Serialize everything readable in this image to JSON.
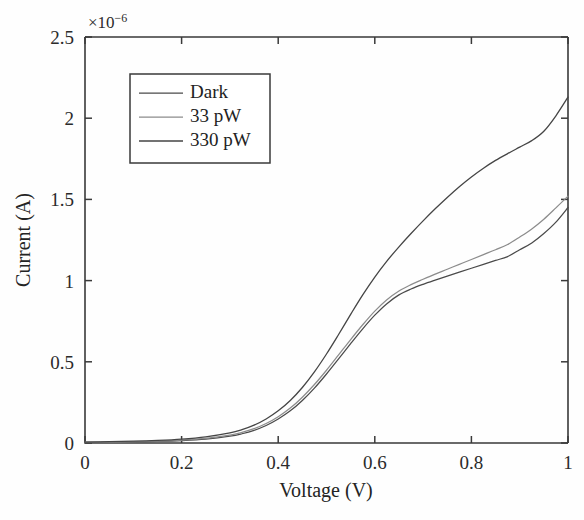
{
  "chart_data": {
    "type": "line",
    "title": "",
    "xlabel": "Voltage (V)",
    "ylabel": "Current (A)",
    "y_multiplier": "×10",
    "y_multiplier_exponent": "−6",
    "y_multiplier_text": "×10⁻⁶",
    "xlim": [
      0,
      1
    ],
    "ylim": [
      0,
      2.5
    ],
    "xticks": [
      "0",
      "0.2",
      "0.4",
      "0.6",
      "0.8",
      "1"
    ],
    "xtick_values": [
      0,
      0.2,
      0.4,
      0.6,
      0.8,
      1
    ],
    "yticks": [
      "0",
      "0.5",
      "1",
      "1.5",
      "2",
      "2.5"
    ],
    "ytick_values": [
      0,
      0.5,
      1.0,
      1.5,
      2.0,
      2.5
    ],
    "grid": false,
    "legend_position": "upper-left-inside",
    "x": [
      0,
      0.05,
      0.1,
      0.15,
      0.2,
      0.25,
      0.3,
      0.325,
      0.35,
      0.375,
      0.4,
      0.425,
      0.45,
      0.475,
      0.5,
      0.525,
      0.55,
      0.575,
      0.6,
      0.625,
      0.65,
      0.675,
      0.7,
      0.725,
      0.75,
      0.775,
      0.8,
      0.825,
      0.85,
      0.875,
      0.9,
      0.925,
      0.95,
      0.975,
      1.0
    ],
    "series": [
      {
        "name": "Dark",
        "color": "#4a4a4a",
        "width": 1.25,
        "values": [
          0.004,
          0.005,
          0.007,
          0.01,
          0.015,
          0.024,
          0.042,
          0.057,
          0.078,
          0.108,
          0.148,
          0.198,
          0.262,
          0.338,
          0.425,
          0.518,
          0.612,
          0.703,
          0.787,
          0.858,
          0.912,
          0.948,
          0.977,
          1.003,
          1.028,
          1.052,
          1.076,
          1.1,
          1.124,
          1.148,
          1.19,
          1.232,
          1.29,
          1.36,
          1.45
        ]
      },
      {
        "name": "33 pW",
        "color": "#8c8c8c",
        "width": 1.25,
        "values": [
          0.005,
          0.006,
          0.008,
          0.012,
          0.018,
          0.028,
          0.048,
          0.065,
          0.088,
          0.12,
          0.162,
          0.215,
          0.282,
          0.36,
          0.448,
          0.542,
          0.637,
          0.728,
          0.812,
          0.882,
          0.936,
          0.975,
          1.008,
          1.04,
          1.07,
          1.1,
          1.13,
          1.16,
          1.19,
          1.222,
          1.268,
          1.318,
          1.378,
          1.448,
          1.52
        ]
      },
      {
        "name": "330 pW",
        "color": "#454545",
        "width": 1.3,
        "values": [
          0.006,
          0.008,
          0.011,
          0.016,
          0.024,
          0.038,
          0.062,
          0.082,
          0.11,
          0.148,
          0.198,
          0.262,
          0.342,
          0.438,
          0.548,
          0.668,
          0.792,
          0.912,
          1.022,
          1.12,
          1.208,
          1.29,
          1.368,
          1.442,
          1.512,
          1.578,
          1.638,
          1.692,
          1.74,
          1.782,
          1.822,
          1.862,
          1.92,
          2.015,
          2.13
        ]
      }
    ]
  },
  "legend": {
    "entries": [
      {
        "label": "Dark"
      },
      {
        "label": "33 pW"
      },
      {
        "label": "330 pW"
      }
    ]
  },
  "axes": {
    "x_title": "Voltage (V)",
    "y_title": "Current (A)"
  }
}
